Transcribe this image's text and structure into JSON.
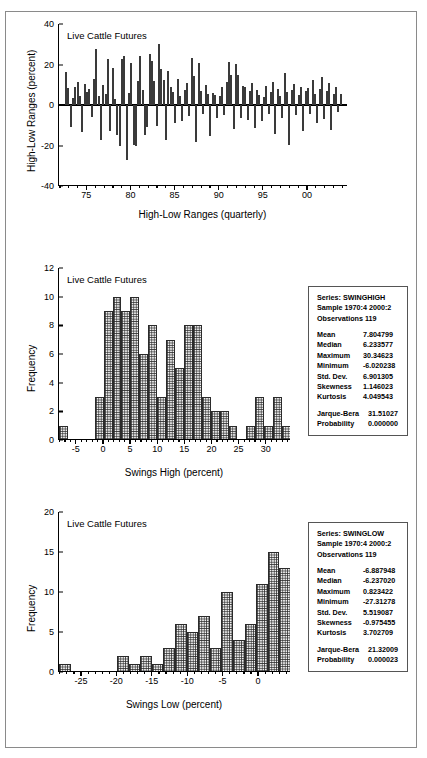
{
  "figure1": {
    "note": "Live Cattle Futures",
    "ylabel": "High-Low Ranges (percent)",
    "xlabel": "High-Low Ranges (quarterly)",
    "yticks": [
      "40",
      "20",
      "0",
      "-20",
      "-40"
    ],
    "xticks": [
      "75",
      "80",
      "85",
      "90",
      "95",
      "00"
    ]
  },
  "figure2": {
    "note": "Live Cattle Futures",
    "ylabel": "Frequency",
    "xlabel": "Swings High (percent)",
    "yticks": [
      "12",
      "10",
      "8",
      "6",
      "4",
      "2",
      "0"
    ],
    "xticks": [
      "-5",
      "0",
      "5",
      "10",
      "15",
      "20",
      "25",
      "30"
    ],
    "stats": {
      "series_label": "Series: SWINGHIGH",
      "sample_label": "Sample 1970:4 2000:2",
      "observations_label": "Observations 119",
      "rows": [
        {
          "name": "Mean",
          "value": "7.804799"
        },
        {
          "name": "Median",
          "value": "6.233577"
        },
        {
          "name": "Maximum",
          "value": "30.34623"
        },
        {
          "name": "Minimum",
          "value": "-6.020238"
        },
        {
          "name": "Std. Dev.",
          "value": "6.901305"
        },
        {
          "name": "Skewness",
          "value": "1.146023"
        },
        {
          "name": "Kurtosis",
          "value": "4.049543"
        }
      ],
      "test_rows": [
        {
          "name": "Jarque-Bera",
          "value": "31.51027"
        },
        {
          "name": "Probability",
          "value": "0.000000"
        }
      ]
    }
  },
  "figure3": {
    "note": "Live Cattle Futures",
    "ylabel": "Frequency",
    "xlabel": "Swings Low (percent)",
    "yticks": [
      "20",
      "15",
      "10",
      "5",
      "0"
    ],
    "xticks": [
      "-25",
      "-20",
      "-15",
      "-10",
      "-5",
      "0"
    ],
    "stats": {
      "series_label": "Series: SWINGLOW",
      "sample_label": "Sample 1970:4 2000:2",
      "observations_label": "Observations 119",
      "rows": [
        {
          "name": "Mean",
          "value": "-6.887948"
        },
        {
          "name": "Median",
          "value": "-6.237020"
        },
        {
          "name": "Maximum",
          "value": "0.823422"
        },
        {
          "name": "Minimum",
          "value": "-27.31278"
        },
        {
          "name": "Std. Dev.",
          "value": "5.519087"
        },
        {
          "name": "Skewness",
          "value": "-0.975455"
        },
        {
          "name": "Kurtosis",
          "value": "3.702709"
        }
      ],
      "test_rows": [
        {
          "name": "Jarque-Bera",
          "value": "21.32009"
        },
        {
          "name": "Probability",
          "value": "0.000023"
        }
      ]
    }
  },
  "chart_data": [
    {
      "type": "bar",
      "id": "high-low-ranges-spike",
      "title": "Live Cattle Futures",
      "xlabel": "High-Low Ranges (quarterly)",
      "ylabel": "High-Low Ranges (percent)",
      "ylim": [
        -40,
        40
      ],
      "yticks": [
        -40,
        -20,
        0,
        20,
        40
      ],
      "xlim": [
        1970.75,
        2000.5
      ],
      "xticks": [
        1975,
        1980,
        1985,
        1990,
        1995,
        2000
      ],
      "xticklabels": [
        "75",
        "80",
        "85",
        "90",
        "95",
        "00"
      ],
      "grid": false,
      "legend": false,
      "note": "Quarterly high-low range spikes, 1970:4-2000:2, 119 observations",
      "values": [
        16.1,
        8.6,
        -10.8,
        3.5,
        9.0,
        11.2,
        4.4,
        -13.5,
        10.5,
        6.2,
        7.9,
        -6.1,
        13.0,
        27.5,
        4.6,
        -17.3,
        9.8,
        5.4,
        22.5,
        -12.6,
        18.1,
        3.1,
        -14.9,
        -20.1,
        22.6,
        24.1,
        -27.3,
        6.0,
        20.5,
        -19.9,
        -20.2,
        12.0,
        24.0,
        7.3,
        -14.8,
        -11.1,
        25.0,
        21.9,
        11.9,
        -10.3,
        30.2,
        18.0,
        12.4,
        -17.5,
        16.6,
        8.8,
        6.3,
        -8.7,
        13.0,
        4.4,
        -8.1,
        7.2,
        11.0,
        -5.2,
        23.2,
        14.4,
        -18.3,
        20.8,
        7.1,
        -4.3,
        9.9,
        5.6,
        -15.2,
        6.1,
        5.1,
        -6.5,
        4.2,
        9.1,
        -5.0,
        11.4,
        21.1,
        14.8,
        -12.0,
        20.3,
        15.0,
        -6.5,
        9.6,
        8.7,
        -7.3,
        6.8,
        10.9,
        -11.3,
        7.4,
        5.0,
        -8.0,
        3.8,
        9.4,
        -4.4,
        6.2,
        11.4,
        -14.1,
        8.1,
        4.5,
        -6.5,
        15.6,
        6.3,
        -19.7,
        7.5,
        10.2,
        -5.1,
        4.9,
        9.0,
        -13.0,
        6.7,
        8.3,
        -4.6,
        12.2,
        5.5,
        -9.0,
        7.8,
        13.8,
        -7.0,
        6.9,
        11.0,
        -12.4,
        5.3,
        8.9,
        -3.4,
        5.2
      ]
    },
    {
      "type": "bar",
      "id": "swings-high-histogram",
      "title": "Live Cattle Futures",
      "xlabel": "Swings High (percent)",
      "ylabel": "Frequency",
      "ylim": [
        0,
        12
      ],
      "yticks": [
        0,
        2,
        4,
        6,
        8,
        10,
        12
      ],
      "xlim": [
        -7.5,
        31.5
      ],
      "xticks": [
        -5,
        0,
        5,
        10,
        15,
        20,
        25,
        30
      ],
      "bin_width": 1.5,
      "grid": false,
      "legend": false,
      "bins": [
        {
          "left": -7.5,
          "value": 1
        },
        {
          "left": -6.0,
          "value": 0
        },
        {
          "left": -4.5,
          "value": 0
        },
        {
          "left": -3.0,
          "value": 0
        },
        {
          "left": -1.5,
          "value": 3
        },
        {
          "left": 0.0,
          "value": 9
        },
        {
          "left": 1.5,
          "value": 10
        },
        {
          "left": 3.0,
          "value": 9
        },
        {
          "left": 4.5,
          "value": 10
        },
        {
          "left": 6.0,
          "value": 6
        },
        {
          "left": 7.5,
          "value": 8
        },
        {
          "left": 9.0,
          "value": 3
        },
        {
          "left": 10.5,
          "value": 7
        },
        {
          "left": 12.0,
          "value": 5
        },
        {
          "left": 13.5,
          "value": 8
        },
        {
          "left": 15.0,
          "value": 8
        },
        {
          "left": 16.5,
          "value": 3
        },
        {
          "left": 18.0,
          "value": 2
        },
        {
          "left": 19.5,
          "value": 2
        },
        {
          "left": 21.0,
          "value": 1
        },
        {
          "left": 22.5,
          "value": 0
        },
        {
          "left": 24.0,
          "value": 1
        },
        {
          "left": 25.5,
          "value": 3
        },
        {
          "left": 27.0,
          "value": 1
        },
        {
          "left": 28.5,
          "value": 3
        },
        {
          "left": 30.0,
          "value": 1
        },
        {
          "left": 31.5,
          "value": 0
        },
        {
          "left": 33.0,
          "value": 1
        },
        {
          "left": 34.5,
          "value": 0
        },
        {
          "left": 36.0,
          "value": 1
        }
      ]
    },
    {
      "type": "bar",
      "id": "swings-low-histogram",
      "title": "Live Cattle Futures",
      "xlabel": "Swings Low (percent)",
      "ylabel": "Frequency",
      "ylim": [
        0,
        20
      ],
      "yticks": [
        0,
        5,
        10,
        15,
        20
      ],
      "xlim": [
        -28.5,
        1.5
      ],
      "xticks": [
        -25,
        -20,
        -15,
        -10,
        -5,
        0
      ],
      "bin_width": 1.5,
      "grid": false,
      "legend": false,
      "bins": [
        {
          "left": -28.5,
          "value": 1
        },
        {
          "left": -27.0,
          "value": 0
        },
        {
          "left": -25.5,
          "value": 0
        },
        {
          "left": -24.0,
          "value": 0
        },
        {
          "left": -22.5,
          "value": 0
        },
        {
          "left": -21.0,
          "value": 2
        },
        {
          "left": -19.5,
          "value": 1
        },
        {
          "left": -18.0,
          "value": 2
        },
        {
          "left": -16.5,
          "value": 1
        },
        {
          "left": -15.0,
          "value": 3
        },
        {
          "left": -13.5,
          "value": 6
        },
        {
          "left": -12.0,
          "value": 5
        },
        {
          "left": -10.5,
          "value": 7
        },
        {
          "left": -9.0,
          "value": 3
        },
        {
          "left": -7.5,
          "value": 10
        },
        {
          "left": -6.0,
          "value": 4
        },
        {
          "left": -4.5,
          "value": 6
        },
        {
          "left": -3.0,
          "value": 11
        },
        {
          "left": -1.5,
          "value": 15
        },
        {
          "left": 0.0,
          "value": 13
        },
        {
          "left": 1.5,
          "value": 9
        },
        {
          "left": 3.0,
          "value": 4
        }
      ]
    }
  ]
}
